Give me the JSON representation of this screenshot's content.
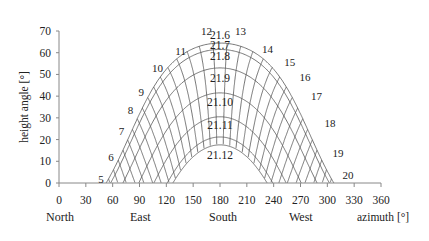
{
  "chart_data": {
    "type": "line",
    "title": "",
    "xlabel": "azimuth [°]",
    "ylabel": "height angle [°]",
    "xlim": [
      0,
      360
    ],
    "ylim": [
      0,
      70
    ],
    "x_ticks": [
      0,
      30,
      60,
      90,
      120,
      150,
      180,
      210,
      240,
      270,
      300,
      330,
      360
    ],
    "y_ticks": [
      0,
      10,
      20,
      30,
      40,
      50,
      60,
      70
    ],
    "grid": false,
    "direction_labels": [
      {
        "label": "North",
        "azimuth": 0
      },
      {
        "label": "East",
        "azimuth": 90
      },
      {
        "label": "South",
        "azimuth": 180
      },
      {
        "label": "West",
        "azimuth": 270
      }
    ],
    "model": {
      "latitude": 49,
      "solar_noon_hour": 12.5
    },
    "series": [
      {
        "name": "21.6",
        "declination": 23.44,
        "peak_altitude": 64.5
      },
      {
        "name": "21.7",
        "declination": 20.5,
        "peak_altitude": 61.5
      },
      {
        "name": "21.8",
        "declination": 12.0,
        "peak_altitude": 53
      },
      {
        "name": "21.9",
        "declination": 0.5,
        "peak_altitude": 41.5
      },
      {
        "name": "21.10",
        "declination": -10.5,
        "peak_altitude": 30.5
      },
      {
        "name": "21.11",
        "declination": -19.8,
        "peak_altitude": 21.2
      },
      {
        "name": "21.12",
        "declination": -23.44,
        "peak_altitude": 17.5
      }
    ],
    "hour_lines": [
      "5",
      "6",
      "7",
      "8",
      "9",
      "10",
      "11",
      "12",
      "13",
      "14",
      "15",
      "16",
      "17",
      "18",
      "19",
      "20"
    ],
    "curve_label_positions": [
      {
        "name": "21.6",
        "x": 180,
        "y": 68
      },
      {
        "name": "21.7",
        "x": 180,
        "y": 63.5
      },
      {
        "name": "21.8",
        "x": 180,
        "y": 58.5
      },
      {
        "name": "21.9",
        "x": 180,
        "y": 48.5
      },
      {
        "name": "21.10",
        "x": 180,
        "y": 37.5
      },
      {
        "name": "21.11",
        "x": 180,
        "y": 26.5
      },
      {
        "name": "21.12",
        "x": 180,
        "y": 13
      }
    ],
    "hour_label_positions": [
      {
        "h": "5",
        "x": 47,
        "y": 2
      },
      {
        "h": "6",
        "x": 58,
        "y": 12
      },
      {
        "h": "7",
        "x": 70,
        "y": 24
      },
      {
        "h": "8",
        "x": 80,
        "y": 33.5
      },
      {
        "h": "9",
        "x": 92,
        "y": 42
      },
      {
        "h": "10",
        "x": 110,
        "y": 53
      },
      {
        "h": "11",
        "x": 136,
        "y": 61
      },
      {
        "h": "12",
        "x": 165,
        "y": 70
      },
      {
        "h": "13",
        "x": 203,
        "y": 70
      },
      {
        "h": "14",
        "x": 233,
        "y": 61.5
      },
      {
        "h": "15",
        "x": 258,
        "y": 55.5
      },
      {
        "h": "16",
        "x": 275,
        "y": 49
      },
      {
        "h": "17",
        "x": 288,
        "y": 40
      },
      {
        "h": "18",
        "x": 303,
        "y": 27.5
      },
      {
        "h": "19",
        "x": 312,
        "y": 14
      },
      {
        "h": "20",
        "x": 323,
        "y": 3.5
      }
    ]
  },
  "axes": {
    "x_title": "azimuth [°]",
    "y_title": "height angle [°]",
    "north": "North",
    "east": "East",
    "south": "South",
    "west": "West"
  }
}
